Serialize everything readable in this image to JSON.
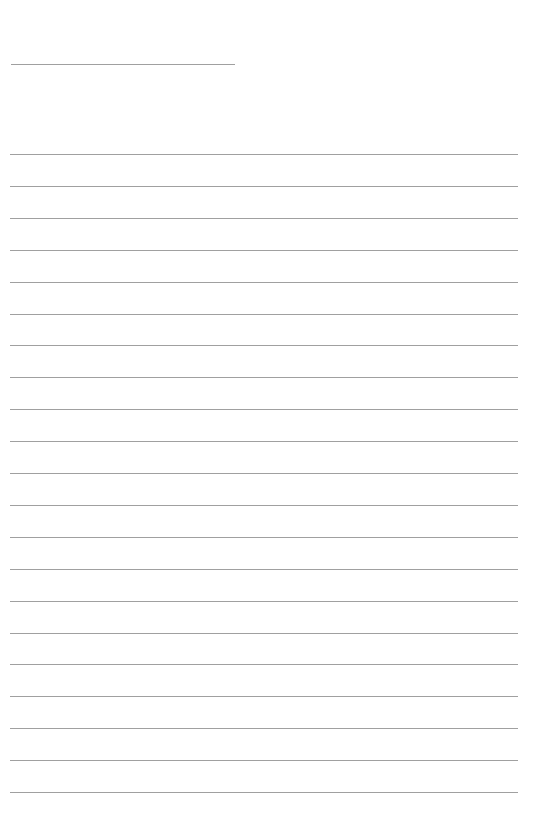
{
  "document": {
    "type": "lined-paper",
    "background_color": "#ffffff",
    "line_color": "#a0a0a0",
    "title_line": {
      "x": 11,
      "y": 64,
      "width": 224
    },
    "ruled_lines": {
      "count": 21,
      "x": 10,
      "width": 508,
      "first_y": 154,
      "spacing": 31.9
    }
  }
}
